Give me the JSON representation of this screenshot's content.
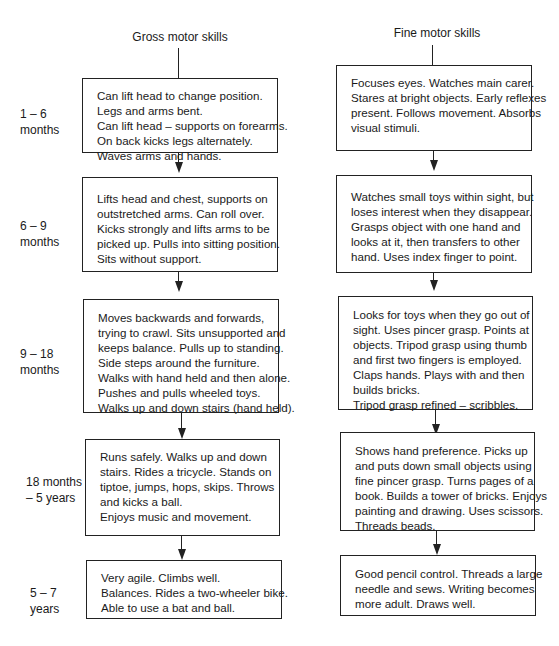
{
  "columns": {
    "gross": {
      "title": "Gross motor skills"
    },
    "fine": {
      "title": "Fine motor skills"
    }
  },
  "stages": [
    {
      "age": [
        "1 – 6",
        "months"
      ],
      "gross": [
        "Can lift head to change position.",
        "Legs and arms bent.",
        "Can lift head – supports on forearms.",
        "On back kicks legs alternately.",
        "Waves arms and hands."
      ],
      "fine": [
        "Focuses eyes. Watches main carer.",
        "Stares at bright objects. Early reflexes",
        "present. Follows movement. Absorbs",
        "visual stimuli."
      ]
    },
    {
      "age": [
        "6 – 9",
        "months"
      ],
      "gross": [
        "Lifts head and chest, supports on",
        "outstretched arms. Can roll over.",
        "Kicks strongly and lifts arms to be",
        "picked up. Pulls into sitting position.",
        "Sits without support."
      ],
      "fine": [
        "Watches small toys within sight, but",
        "loses interest when they disappear.",
        "Grasps object with one hand and",
        "looks at it, then transfers to other",
        "hand. Uses index finger to point."
      ]
    },
    {
      "age": [
        "9 – 18",
        "months"
      ],
      "gross": [
        "Moves backwards and forwards,",
        "trying to crawl. Sits unsupported and",
        "keeps balance. Pulls up to standing.",
        "Side steps around the furniture.",
        "Walks with hand held and then alone.",
        "Pushes and pulls wheeled toys.",
        "Walks up and down stairs (hand held)."
      ],
      "fine": [
        "Looks for toys when they go out of",
        "sight. Uses pincer grasp. Points at",
        "objects. Tripod grasp using thumb",
        "and first two fingers is employed.",
        "Claps hands. Plays with and then",
        "builds bricks.",
        "Tripod grasp refined – scribbles."
      ]
    },
    {
      "age": [
        "18 months",
        "– 5 years"
      ],
      "gross": [
        "Runs safely. Walks up and down",
        "stairs. Rides a tricycle. Stands on",
        "tiptoe, jumps, hops, skips. Throws",
        "and kicks a ball.",
        "Enjoys music and movement."
      ],
      "fine": [
        "Shows hand preference. Picks up",
        "and puts down small objects using",
        "fine pincer grasp. Turns pages of a",
        "book. Builds a tower of bricks. Enjoys",
        "painting and drawing. Uses scissors.",
        "Threads beads."
      ]
    },
    {
      "age": [
        "5 – 7",
        "years"
      ],
      "gross": [
        "Very agile. Climbs well.",
        "Balances. Rides a two-wheeler bike.",
        "Able to use a bat and ball."
      ],
      "fine": [
        "Good pencil control. Threads a large",
        "needle and sews. Writing becomes",
        "more adult. Draws well."
      ]
    }
  ]
}
